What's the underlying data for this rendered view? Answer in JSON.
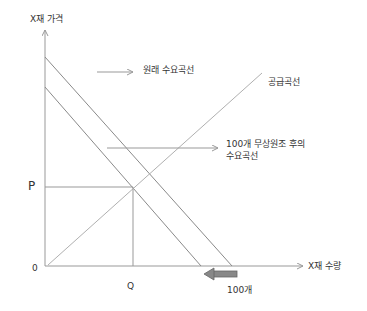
{
  "diagram": {
    "title": "",
    "y_axis_label": "X재 가격",
    "x_axis_label": "X재 수량",
    "origin_label": "0",
    "price_label": "P",
    "quantity_label": "Q",
    "original_demand_label": "원래 수요곡선",
    "supply_label": "공급곡선",
    "new_demand_label_line1": "100개 무상원조 후의",
    "new_demand_label_line2": "수요곡선",
    "shift_label": "100개",
    "colors": {
      "axis": "#999999",
      "curve": "#8a8a8a",
      "supply": "#b0b0b0",
      "shift_arrow": "#777777",
      "text": "#333333"
    }
  }
}
